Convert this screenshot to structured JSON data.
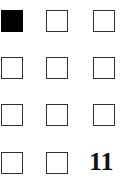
{
  "grid": {
    "rows": 4,
    "cols": 3,
    "cells": [
      {
        "row": 0,
        "col": 0,
        "state": "filled"
      },
      {
        "row": 0,
        "col": 1,
        "state": "empty"
      },
      {
        "row": 0,
        "col": 2,
        "state": "empty"
      },
      {
        "row": 1,
        "col": 0,
        "state": "empty"
      },
      {
        "row": 1,
        "col": 1,
        "state": "empty"
      },
      {
        "row": 1,
        "col": 2,
        "state": "empty"
      },
      {
        "row": 2,
        "col": 0,
        "state": "empty"
      },
      {
        "row": 2,
        "col": 1,
        "state": "empty"
      },
      {
        "row": 2,
        "col": 2,
        "state": "empty"
      },
      {
        "row": 3,
        "col": 0,
        "state": "empty"
      },
      {
        "row": 3,
        "col": 1,
        "state": "empty"
      },
      {
        "row": 3,
        "col": 2,
        "state": "number",
        "value": "11"
      }
    ]
  },
  "colors": {
    "filled": "#000000",
    "border": "#333333",
    "background": "#ffffff"
  }
}
